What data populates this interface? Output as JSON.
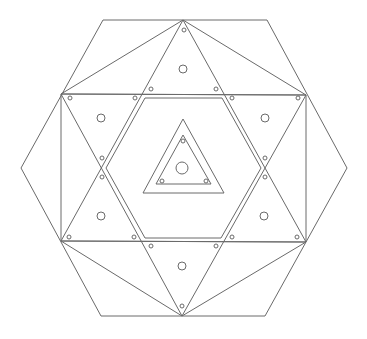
{
  "diagram": {
    "stroke_color": "#6a6a6a",
    "background": "#ffffff",
    "outer_hexagon": [
      [
        103,
        20
      ],
      [
        267,
        20
      ],
      [
        347,
        168
      ],
      [
        265,
        316
      ],
      [
        101,
        316
      ],
      [
        21,
        168
      ]
    ],
    "star_vertices": {
      "top": [
        183,
        20
      ],
      "bottom": [
        182,
        316
      ],
      "upper_left": [
        61,
        94
      ],
      "upper_right": [
        306,
        95
      ],
      "lower_left": [
        61,
        241
      ],
      "lower_right": [
        306,
        242
      ]
    },
    "star_triangle_up": [
      [
        183,
        20
      ],
      [
        306,
        242
      ],
      [
        61,
        241
      ]
    ],
    "star_triangle_down": [
      [
        182,
        316
      ],
      [
        61,
        94
      ],
      [
        306,
        95
      ]
    ],
    "rectangle": [
      [
        61,
        94
      ],
      [
        306,
        95
      ],
      [
        306,
        242
      ],
      [
        61,
        241
      ]
    ],
    "connector_lines": [
      [
        [
          183,
          20
        ],
        [
          61,
          94
        ]
      ],
      [
        [
          183,
          20
        ],
        [
          306,
          95
        ]
      ],
      [
        [
          182,
          316
        ],
        [
          61,
          241
        ]
      ],
      [
        [
          182,
          316
        ],
        [
          306,
          242
        ]
      ]
    ],
    "inner_hexagon": [
      [
        145,
        98
      ],
      [
        222,
        98
      ],
      [
        261,
        168
      ],
      [
        221,
        238
      ],
      [
        145,
        238
      ],
      [
        106,
        168
      ]
    ],
    "central_triangle_outer": [
      [
        183,
        119
      ],
      [
        224,
        193
      ],
      [
        143,
        193
      ]
    ],
    "central_triangle_inner": [
      [
        183,
        135
      ],
      [
        211,
        184
      ],
      [
        156,
        184
      ]
    ],
    "large_circles": [
      {
        "cx": 183,
        "cy": 69,
        "r": 4
      },
      {
        "cx": 101,
        "cy": 118,
        "r": 4
      },
      {
        "cx": 265,
        "cy": 118,
        "r": 4
      },
      {
        "cx": 101,
        "cy": 216,
        "r": 4
      },
      {
        "cx": 264,
        "cy": 216,
        "r": 4
      },
      {
        "cx": 182,
        "cy": 266,
        "r": 4
      },
      {
        "cx": 182,
        "cy": 168,
        "r": 6
      }
    ],
    "small_circles": [
      {
        "cx": 184,
        "cy": 30
      },
      {
        "cx": 151,
        "cy": 89
      },
      {
        "cx": 216,
        "cy": 89
      },
      {
        "cx": 70,
        "cy": 98
      },
      {
        "cx": 135,
        "cy": 98
      },
      {
        "cx": 232,
        "cy": 98
      },
      {
        "cx": 298,
        "cy": 98
      },
      {
        "cx": 102,
        "cy": 158
      },
      {
        "cx": 102,
        "cy": 177
      },
      {
        "cx": 265,
        "cy": 158
      },
      {
        "cx": 265,
        "cy": 177
      },
      {
        "cx": 69,
        "cy": 237
      },
      {
        "cx": 134,
        "cy": 237
      },
      {
        "cx": 232,
        "cy": 237
      },
      {
        "cx": 297,
        "cy": 237
      },
      {
        "cx": 151,
        "cy": 246
      },
      {
        "cx": 216,
        "cy": 246
      },
      {
        "cx": 182,
        "cy": 306
      },
      {
        "cx": 183,
        "cy": 141
      },
      {
        "cx": 162,
        "cy": 181
      },
      {
        "cx": 206,
        "cy": 181
      }
    ],
    "small_circle_radius": 2
  }
}
